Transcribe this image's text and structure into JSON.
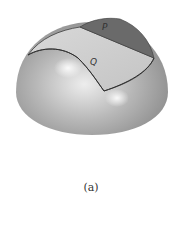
{
  "figure": {
    "labels": {
      "p": "P",
      "q": "Q"
    },
    "caption": "(a)",
    "colors": {
      "dome_light": "#e8e8e8",
      "dome_dark": "#8a8a8a",
      "surface_q": "#cfcfcf",
      "surface_p": "#666666",
      "edge": "#3a3a3a"
    }
  }
}
